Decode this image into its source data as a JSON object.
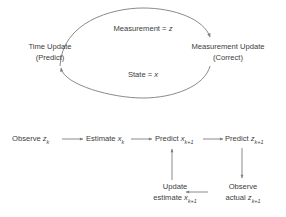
{
  "figure": {
    "stroke_color": "#7d7d7d",
    "text_color": "#3c3c3c",
    "background": "#ffffff"
  },
  "cycle": {
    "left_node": {
      "line1": "Time Update",
      "line2": "(Predict)"
    },
    "right_node": {
      "line1": "Measurement Update",
      "line2": "(Correct)"
    },
    "top_arc_label": {
      "prefix": "Measurement = ",
      "symbol": "z"
    },
    "bottom_arc_label": {
      "prefix": "State = ",
      "symbol": "x"
    }
  },
  "flow": {
    "step1": {
      "text": "Observe ",
      "symbol": "z",
      "subscript": "k"
    },
    "step2": {
      "text": "Estimate ",
      "symbol": "x",
      "subscript": "k"
    },
    "step3": {
      "text": "Predict ",
      "symbol": "x",
      "subscript": "k+1"
    },
    "step4": {
      "text": "Predict ",
      "symbol": "z",
      "subscript": "k+1"
    },
    "step5": {
      "line1": "Update",
      "line2_text": "estimate ",
      "symbol": "x",
      "subscript": "k+1"
    },
    "step6": {
      "line1": "Observe",
      "line2_text": "actual ",
      "symbol": "z",
      "subscript": "k+1"
    }
  }
}
